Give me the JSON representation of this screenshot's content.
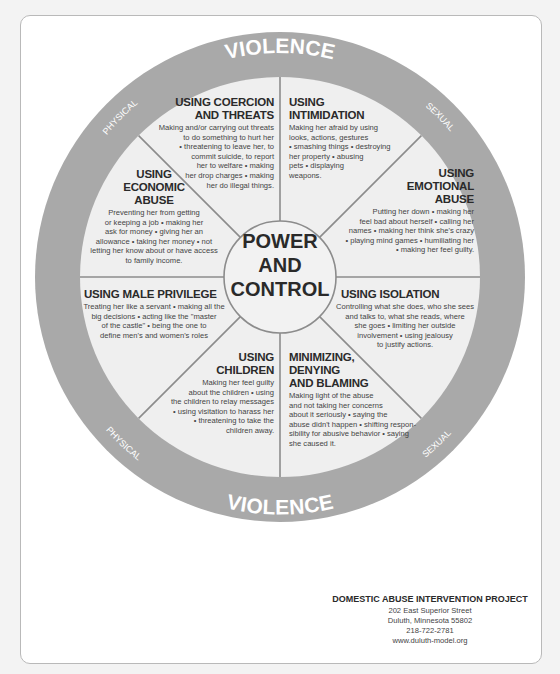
{
  "ring": {
    "top_label": "VIOLENCE",
    "top_left": "PHYSICAL",
    "top_right": "SEXUAL",
    "bottom_label": "VIOLENCE",
    "bottom_left": "PHYSICAL",
    "bottom_right": "SEXUAL",
    "ring_color": "#a9a9a9",
    "inner_color": "#efefef"
  },
  "center": {
    "line1": "POWER",
    "line2": "AND",
    "line3": "CONTROL"
  },
  "wedges": [
    {
      "id": "coercion",
      "title": "USING COERCION AND THREATS",
      "title_lines": [
        "USING COERCION",
        "AND THREATS"
      ],
      "body_lines": [
        "Making and/or carrying out threats",
        "to do something to hurt her",
        "• threatening to leave her, to",
        "commit suicide, to report",
        "her to welfare • making",
        "her drop charges • making",
        "her do illegal things."
      ]
    },
    {
      "id": "intimidation",
      "title": "USING INTIMIDATION",
      "title_lines": [
        "USING",
        "INTIMIDATION"
      ],
      "body_lines": [
        "Making her afraid by using",
        "looks, actions, gestures",
        "• smashing things • destroying",
        "her property • abusing",
        "pets • displaying",
        "weapons."
      ]
    },
    {
      "id": "emotional",
      "title": "USING EMOTIONAL ABUSE",
      "title_lines": [
        "USING",
        "EMOTIONAL",
        "ABUSE"
      ],
      "body_lines": [
        "Putting her down • making her",
        "feel bad about herself • calling her",
        "names • making her think she's crazy",
        "• playing mind games • humiliating her",
        "• making her feel guilty."
      ]
    },
    {
      "id": "isolation",
      "title": "USING ISOLATION",
      "title_lines": [
        "USING ISOLATION"
      ],
      "body_lines": [
        "Controlling what she does, who she sees",
        "and talks to, what she reads, where",
        "she goes • limiting her outside",
        "involvement • using jealousy",
        "to justify actions."
      ]
    },
    {
      "id": "minimizing",
      "title": "MINIMIZING, DENYING AND BLAMING",
      "title_lines": [
        "MINIMIZING,",
        "DENYING",
        "AND BLAMING"
      ],
      "body_lines": [
        "Making light of the abuse",
        "and not taking her concerns",
        "about it seriously • saying the",
        "abuse didn't happen • shifting respon-",
        "sibility for abusive behavior • saying",
        "she caused it."
      ]
    },
    {
      "id": "children",
      "title": "USING CHILDREN",
      "title_lines": [
        "USING",
        "CHILDREN"
      ],
      "body_lines": [
        "Making her feel guilty",
        "about the children • using",
        "the children to relay messages",
        "• using visitation to harass her",
        "• threatening to take the",
        "children away."
      ]
    },
    {
      "id": "male_privilege",
      "title": "USING MALE PRIVILEGE",
      "title_lines": [
        "USING MALE PRIVILEGE"
      ],
      "body_lines": [
        "Treating her like a servant • making all the",
        "big decisions • acting like the \"master",
        "of the castle\" • being the one to",
        "define men's and women's roles"
      ]
    },
    {
      "id": "economic",
      "title": "USING ECONOMIC ABUSE",
      "title_lines": [
        "USING",
        "ECONOMIC",
        "ABUSE"
      ],
      "body_lines": [
        "Preventing her from getting",
        "or keeping a job • making her",
        "ask for money • giving her an",
        "allowance • taking her money • not",
        "letting her know about or have access",
        "to family income."
      ]
    }
  ],
  "footer": {
    "org": "DOMESTIC ABUSE INTERVENTION PROJECT",
    "address": "202 East Superior Street",
    "city": "Duluth, Minnesota 55802",
    "phone": "218-722-2781",
    "website": "www.duluth-model.org"
  }
}
